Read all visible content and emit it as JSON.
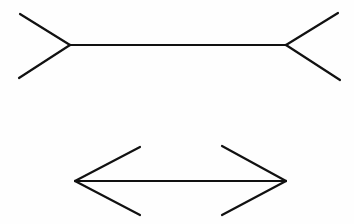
{
  "figure": {
    "background_color": "#fefefe",
    "stroke_color": "#111111",
    "stroke_width": 2.2,
    "canvas": {
      "width": 354,
      "height": 224
    }
  },
  "chart_data": {
    "type": "diagram",
    "xlabel": "",
    "ylabel": "",
    "grid": false,
    "legend": "none",
    "xlim": [
      0,
      354
    ],
    "ylim": [
      0,
      224
    ],
    "figures": [
      {
        "name": "fins-in-figure",
        "label": "Upper figure: arrow-tails pointing inward",
        "shaft": {
          "x1": 70,
          "y1": 45,
          "x2": 286,
          "y2": 45,
          "length": 216
        },
        "fins": [
          {
            "name": "upper-left-fin",
            "x1": 70,
            "y1": 45,
            "x2": 20,
            "y2": 14
          },
          {
            "name": "lower-left-fin",
            "x1": 70,
            "y1": 45,
            "x2": 19,
            "y2": 78
          },
          {
            "name": "upper-right-fin",
            "x1": 286,
            "y1": 45,
            "x2": 338,
            "y2": 13
          },
          {
            "name": "lower-right-fin",
            "x1": 286,
            "y1": 45,
            "x2": 340,
            "y2": 80
          }
        ]
      },
      {
        "name": "arrows-out-figure",
        "label": "Lower figure: arrowheads pointing outward",
        "shaft": {
          "x1": 75,
          "y1": 181,
          "x2": 286,
          "y2": 181,
          "length": 211
        },
        "fins": [
          {
            "name": "upper-left-arrowhead",
            "x1": 75,
            "y1": 181,
            "x2": 140,
            "y2": 147
          },
          {
            "name": "lower-left-arrowhead",
            "x1": 75,
            "y1": 181,
            "x2": 140,
            "y2": 215
          },
          {
            "name": "upper-right-arrowhead",
            "x1": 286,
            "y1": 181,
            "x2": 222,
            "y2": 146
          },
          {
            "name": "lower-right-arrowhead",
            "x1": 286,
            "y1": 181,
            "x2": 222,
            "y2": 215
          }
        ]
      }
    ]
  }
}
